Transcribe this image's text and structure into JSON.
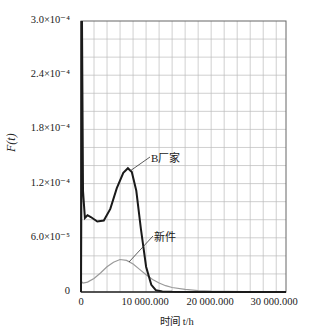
{
  "chart_data": {
    "type": "line",
    "title": "",
    "xlabel": "时间 t/h",
    "ylabel": "F(t)",
    "xlim": [
      0,
      31500000
    ],
    "ylim": [
      0,
      0.0003
    ],
    "grid": true,
    "x_ticks": [
      0,
      10000000,
      20000000,
      30000000
    ],
    "x_tick_labels": [
      "0",
      "10 000.000",
      "20 000.000",
      "30 000.000"
    ],
    "y_ticks": [
      0,
      6e-05,
      0.00012,
      0.00018,
      0.00024,
      0.0003
    ],
    "y_tick_labels": [
      "0",
      "6.0×10⁻⁵",
      "1.2×10⁻⁴",
      "1.8×10⁻⁴",
      "2.4×10⁻⁴",
      "3.0×10⁻⁴"
    ],
    "legend": "inline annotations",
    "series": [
      {
        "name": "B厂家",
        "color": "#1a1a1a",
        "x": [
          0,
          150000,
          300000,
          600000,
          1000000,
          1500000,
          2500000,
          3500000,
          4500000,
          5500000,
          6500000,
          7200000,
          7800000,
          8500000,
          9200000,
          10000000,
          10800000,
          11500000,
          12500000,
          14000000,
          17000000,
          20000000,
          25000000,
          31500000
        ],
        "y": [
          0,
          0.0003,
          0.000112,
          8.2e-05,
          8.5e-05,
          8.3e-05,
          7.8e-05,
          7.9e-05,
          9.2e-05,
          0.000115,
          0.000132,
          0.000137,
          0.000133,
          0.000112,
          7e-05,
          2.8e-05,
          8e-06,
          2e-06,
          5e-07,
          2e-07,
          1e-07,
          0.0,
          0.0,
          0.0
        ]
      },
      {
        "name": "新件",
        "color": "#9a9a9a",
        "x": [
          0,
          300000,
          1000000,
          2000000,
          3000000,
          4000000,
          5000000,
          6000000,
          7000000,
          8000000,
          9000000,
          10000000,
          11000000,
          12000000,
          13000000,
          14000000,
          16000000,
          18000000,
          20000000,
          25000000,
          31500000
        ],
        "y": [
          1.2e-05,
          1e-05,
          1.1e-05,
          1.5e-05,
          2.1e-05,
          2.8e-05,
          3.3e-05,
          3.6e-05,
          3.5e-05,
          3.1e-05,
          2.5e-05,
          1.9e-05,
          1.4e-05,
          1e-05,
          7e-06,
          5e-06,
          3e-06,
          1.5e-06,
          1e-06,
          5e-07,
          3e-07
        ]
      }
    ],
    "annotations": [
      {
        "text": "B厂家",
        "x": 10600000,
        "y": 0.000147
      },
      {
        "text": "新件",
        "x": 11000000,
        "y": 6.3e-05
      }
    ]
  },
  "labels": {
    "ylabel_text": "F(t)",
    "xlabel_text": "时间 t/h",
    "annotation_b": "B厂家",
    "annotation_new": "新件",
    "y0": "0",
    "y1": "6.0×10⁻⁵",
    "y2": "1.2×10⁻⁴",
    "y3": "1.8×10⁻⁴",
    "y4": "2.4×10⁻⁴",
    "y5": "3.0×10⁻⁴",
    "x0": "0",
    "x1": "10 000.000",
    "x2": "20 000.000",
    "x3": "30 000.000"
  }
}
